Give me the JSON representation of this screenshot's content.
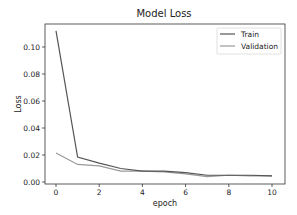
{
  "chart_data": {
    "type": "line",
    "title": "Model Loss",
    "xlabel": "epoch",
    "ylabel": "Loss",
    "x": [
      0,
      1,
      2,
      3,
      4,
      5,
      6,
      7,
      8,
      9,
      10
    ],
    "series": [
      {
        "name": "Train",
        "color": "#555555",
        "values": [
          0.112,
          0.0185,
          0.014,
          0.01,
          0.008,
          0.008,
          0.007,
          0.005,
          0.005,
          0.005,
          0.0045
        ]
      },
      {
        "name": "Validation",
        "color": "#999999",
        "values": [
          0.0215,
          0.013,
          0.012,
          0.008,
          0.008,
          0.0075,
          0.006,
          0.004,
          0.005,
          0.0045,
          0.0045
        ]
      }
    ],
    "xticks": [
      "0",
      "2",
      "4",
      "6",
      "8",
      "10"
    ],
    "yticks": [
      "0.00",
      "0.02",
      "0.04",
      "0.06",
      "0.08",
      "0.10"
    ],
    "xlim": [
      -0.5,
      10.5
    ],
    "ylim": [
      -0.0015,
      0.117
    ],
    "grid": false,
    "legend_position": "upper right"
  }
}
